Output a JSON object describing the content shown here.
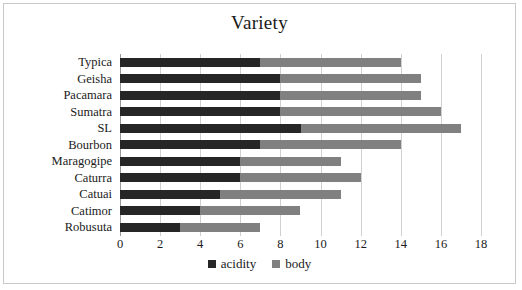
{
  "chart_data": {
    "type": "bar",
    "orientation": "horizontal",
    "stacked": true,
    "title": "Variety",
    "xlabel": "",
    "ylabel": "",
    "xlim": [
      0,
      18
    ],
    "xticks": [
      0,
      2,
      4,
      6,
      8,
      10,
      12,
      14,
      16,
      18
    ],
    "grid": true,
    "legend_position": "bottom",
    "categories": [
      "Typica",
      "Geisha",
      "Pacamara",
      "Sumatra",
      "SL",
      "Bourbon",
      "Maragogipe",
      "Caturra",
      "Catuai",
      "Catimor",
      "Robusuta"
    ],
    "series": [
      {
        "name": "acidity",
        "color": "#262626",
        "values": [
          7,
          8,
          8,
          8,
          9,
          7,
          6,
          6,
          5,
          4,
          3
        ]
      },
      {
        "name": "body",
        "color": "#808080",
        "values": [
          7,
          7,
          7,
          8,
          8,
          7,
          5,
          6,
          6,
          5,
          4
        ]
      }
    ],
    "cumulative_ends": {
      "acidity": [
        7,
        8,
        8,
        8,
        9,
        7,
        6,
        6,
        5,
        4,
        3
      ],
      "body": [
        14,
        15,
        15,
        16,
        17,
        14,
        11,
        12,
        11,
        9,
        7
      ]
    }
  },
  "legend": {
    "items": [
      {
        "label": "acidity",
        "color": "#262626",
        "marker": "square-marker-dark"
      },
      {
        "label": "body",
        "color": "#808080",
        "marker": "square-marker-gray"
      }
    ]
  },
  "frame": {
    "border_color": "#c9c9c9",
    "background": "#ffffff",
    "gridline_color": "#d0d0d0",
    "axis_color": "#9a9a9a"
  }
}
